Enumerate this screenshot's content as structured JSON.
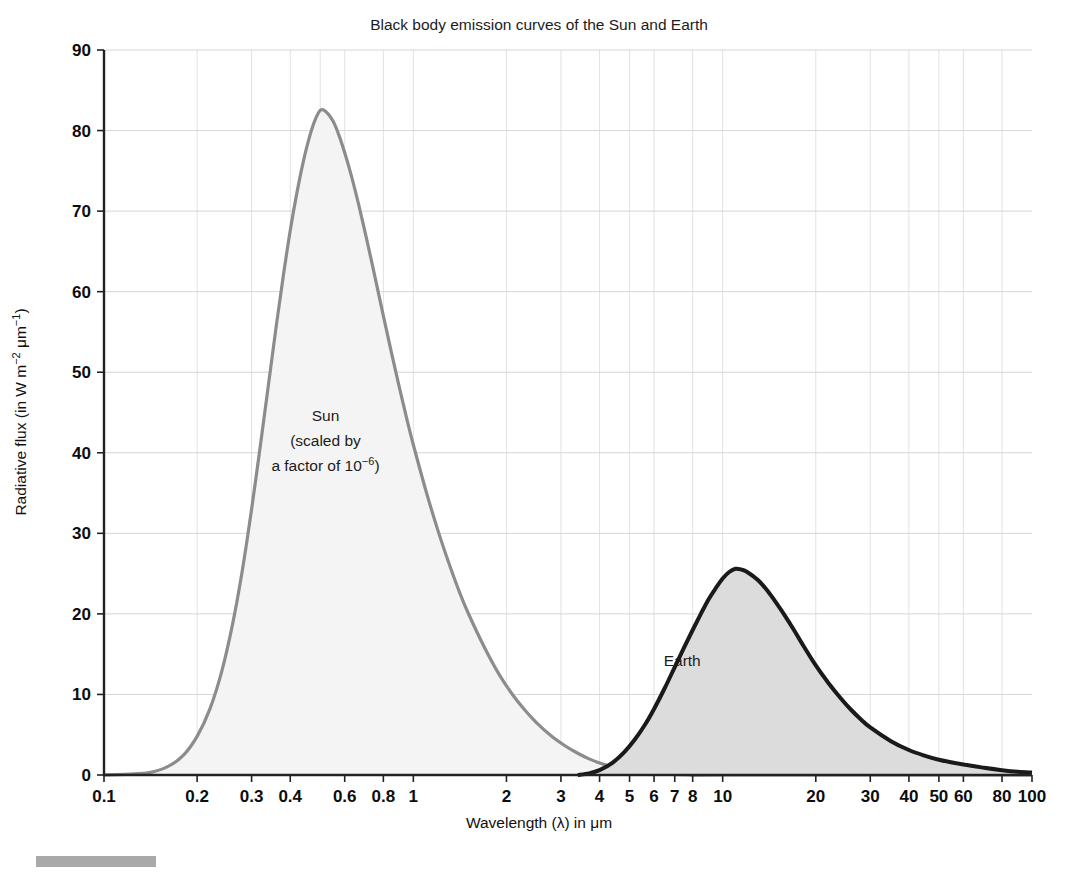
{
  "chart_data": {
    "type": "area",
    "title": "Black body emission curves of the Sun and Earth",
    "xlabel": "Wavelength (λ) in μm",
    "ylabel_parts": {
      "main": "Radiative flux (in W m",
      "sup1": "−2",
      "mid": " μm",
      "sup2": "−1",
      "tail": ")"
    },
    "ylabel": "Radiative flux (in W m−2 μm−1)",
    "xscale": "log",
    "yscale": "linear",
    "xlim": [
      0.1,
      100
    ],
    "ylim": [
      0,
      90
    ],
    "grid": true,
    "legend_position": "inline-annotation",
    "xticks": [
      {
        "value": 0.1,
        "label": "0.1"
      },
      {
        "value": 0.2,
        "label": "0.2"
      },
      {
        "value": 0.3,
        "label": "0.3"
      },
      {
        "value": 0.4,
        "label": "0.4"
      },
      {
        "value": 0.6,
        "label": "0.6"
      },
      {
        "value": 0.8,
        "label": "0.8"
      },
      {
        "value": 1,
        "label": "1"
      },
      {
        "value": 2,
        "label": "2"
      },
      {
        "value": 3,
        "label": "3"
      },
      {
        "value": 4,
        "label": "4"
      },
      {
        "value": 5,
        "label": "5"
      },
      {
        "value": 6,
        "label": "6"
      },
      {
        "value": 7,
        "label": "7"
      },
      {
        "value": 8,
        "label": "8"
      },
      {
        "value": 10,
        "label": "10"
      },
      {
        "value": 20,
        "label": "20"
      },
      {
        "value": 30,
        "label": "30"
      },
      {
        "value": 40,
        "label": "40"
      },
      {
        "value": 50,
        "label": "50"
      },
      {
        "value": 60,
        "label": "60"
      },
      {
        "value": 80,
        "label": "80"
      },
      {
        "value": 100,
        "label": "100"
      }
    ],
    "xgrid_values": [
      0.2,
      0.3,
      0.4,
      0.5,
      0.6,
      0.8,
      1,
      2,
      3,
      4,
      5,
      6,
      8,
      10,
      20,
      30,
      40,
      50,
      60,
      80
    ],
    "yticks": [
      0,
      10,
      20,
      30,
      40,
      50,
      60,
      70,
      80,
      90
    ],
    "series": [
      {
        "name": "Sun",
        "annotation_lines": [
          "Sun",
          "(scaled by",
          "a factor of 10"
        ],
        "annotation_sup": "−6",
        "annotation_tail": ")",
        "annotation_x": 0.52,
        "annotation_y": 44,
        "line_color": "#8c8c8c",
        "fill_color": "#f4f4f4",
        "peak": {
          "x": 0.5,
          "y": 82.5
        },
        "points": [
          [
            0.1,
            0.0
          ],
          [
            0.12,
            0.1
          ],
          [
            0.14,
            0.3
          ],
          [
            0.16,
            1.0
          ],
          [
            0.18,
            2.4
          ],
          [
            0.2,
            4.8
          ],
          [
            0.22,
            8.2
          ],
          [
            0.24,
            12.8
          ],
          [
            0.26,
            18.6
          ],
          [
            0.28,
            25.4
          ],
          [
            0.3,
            33.0
          ],
          [
            0.32,
            40.8
          ],
          [
            0.34,
            48.4
          ],
          [
            0.36,
            55.6
          ],
          [
            0.38,
            62.0
          ],
          [
            0.4,
            67.6
          ],
          [
            0.42,
            72.2
          ],
          [
            0.44,
            76.0
          ],
          [
            0.46,
            79.0
          ],
          [
            0.48,
            81.2
          ],
          [
            0.5,
            82.5
          ],
          [
            0.52,
            82.4
          ],
          [
            0.55,
            81.2
          ],
          [
            0.58,
            79.0
          ],
          [
            0.62,
            75.4
          ],
          [
            0.66,
            71.4
          ],
          [
            0.7,
            67.2
          ],
          [
            0.75,
            62.0
          ],
          [
            0.8,
            57.0
          ],
          [
            0.85,
            52.4
          ],
          [
            0.9,
            48.2
          ],
          [
            0.95,
            44.4
          ],
          [
            1.0,
            41.0
          ],
          [
            1.1,
            35.2
          ],
          [
            1.2,
            30.4
          ],
          [
            1.3,
            26.4
          ],
          [
            1.4,
            23.0
          ],
          [
            1.5,
            20.2
          ],
          [
            1.7,
            15.8
          ],
          [
            1.9,
            12.4
          ],
          [
            2.1,
            9.9
          ],
          [
            2.3,
            8.0
          ],
          [
            2.5,
            6.5
          ],
          [
            2.8,
            4.8
          ],
          [
            3.1,
            3.6
          ],
          [
            3.4,
            2.7
          ],
          [
            3.7,
            2.0
          ],
          [
            4.0,
            1.5
          ],
          [
            4.5,
            0.9
          ],
          [
            5.0,
            0.5
          ],
          [
            6.0,
            0.2
          ],
          [
            8.0,
            0.0
          ],
          [
            10.0,
            0.0
          ],
          [
            100.0,
            0.0
          ]
        ]
      },
      {
        "name": "Earth",
        "annotation_lines": [
          "Earth"
        ],
        "annotation_x": 7.4,
        "annotation_y": 13.5,
        "line_color": "#1a1a1a",
        "fill_color": "#dcdcdc",
        "peak": {
          "x": 10.0,
          "y": 25.6
        },
        "points": [
          [
            3.4,
            0.0
          ],
          [
            3.7,
            0.2
          ],
          [
            4.0,
            0.6
          ],
          [
            4.4,
            1.5
          ],
          [
            4.8,
            2.8
          ],
          [
            5.2,
            4.4
          ],
          [
            5.6,
            6.2
          ],
          [
            6.0,
            8.2
          ],
          [
            6.5,
            10.8
          ],
          [
            7.0,
            13.4
          ],
          [
            7.5,
            15.8
          ],
          [
            8.0,
            18.0
          ],
          [
            8.5,
            20.0
          ],
          [
            9.0,
            21.8
          ],
          [
            9.5,
            23.2
          ],
          [
            10.0,
            24.4
          ],
          [
            10.5,
            25.2
          ],
          [
            11.0,
            25.6
          ],
          [
            11.5,
            25.5
          ],
          [
            12.0,
            25.2
          ],
          [
            13.0,
            24.2
          ],
          [
            14.0,
            22.8
          ],
          [
            15.0,
            21.2
          ],
          [
            16.0,
            19.6
          ],
          [
            17.0,
            18.0
          ],
          [
            18.0,
            16.4
          ],
          [
            20.0,
            13.6
          ],
          [
            22.0,
            11.4
          ],
          [
            24.0,
            9.6
          ],
          [
            26.0,
            8.1
          ],
          [
            28.0,
            6.9
          ],
          [
            30.0,
            5.9
          ],
          [
            35.0,
            4.2
          ],
          [
            40.0,
            3.1
          ],
          [
            45.0,
            2.4
          ],
          [
            50.0,
            1.9
          ],
          [
            60.0,
            1.3
          ],
          [
            70.0,
            0.9
          ],
          [
            80.0,
            0.6
          ],
          [
            90.0,
            0.4
          ],
          [
            100.0,
            0.3
          ]
        ]
      }
    ]
  }
}
